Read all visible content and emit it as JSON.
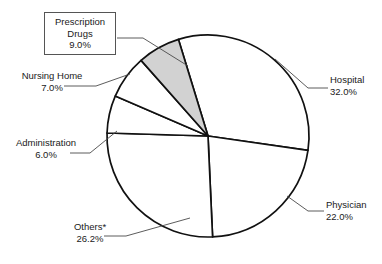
{
  "chart_data": {
    "type": "pie",
    "title": "",
    "subtitle": "",
    "xlabel": "",
    "ylabel": "",
    "legend_position": "callout-labels",
    "grid": false,
    "center": {
      "x": 208,
      "y": 136
    },
    "radius": 101,
    "start_angle_deg": -17,
    "direction": "clockwise",
    "categories": [
      "Hospital",
      "Physician",
      "Others*",
      "Administration",
      "Nursing Home",
      "Prescription Drugs"
    ],
    "values": [
      32.0,
      22.0,
      26.2,
      6.0,
      7.0,
      9.0
    ],
    "value_labels": [
      "32.0%",
      "22.0%",
      "26.2%",
      "6.0%",
      "7.0%",
      "9.0%"
    ],
    "slices": [
      {
        "name": "Hospital",
        "value": 32.0,
        "value_label": "32.0%",
        "fill": "#ffffff",
        "stroke": "#111111",
        "boxed_label": false,
        "start_deg": -17.0,
        "end_deg": 98.2
      },
      {
        "name": "Physician",
        "value": 22.0,
        "value_label": "22.0%",
        "fill": "#ffffff",
        "stroke": "#111111",
        "boxed_label": false,
        "start_deg": 98.2,
        "end_deg": 177.4
      },
      {
        "name": "Others*",
        "value": 26.2,
        "value_label": "26.2%",
        "fill": "#ffffff",
        "stroke": "#111111",
        "boxed_label": false,
        "start_deg": 177.4,
        "end_deg": 271.7
      },
      {
        "name": "Administration",
        "value": 6.0,
        "value_label": "6.0%",
        "fill": "#ffffff",
        "stroke": "#111111",
        "boxed_label": false,
        "start_deg": 271.7,
        "end_deg": 293.3
      },
      {
        "name": "Nursing Home",
        "value": 7.0,
        "value_label": "7.0%",
        "fill": "#ffffff",
        "stroke": "#111111",
        "boxed_label": false,
        "start_deg": 293.3,
        "end_deg": 318.5
      },
      {
        "name": "Prescription Drugs",
        "value": 9.0,
        "value_label": "9.0%",
        "fill": "#d2d2d2",
        "stroke": "#111111",
        "boxed_label": true,
        "start_deg": 318.5,
        "end_deg": 343.0
      }
    ],
    "colors": {
      "slice_default_fill": "#ffffff",
      "slice_highlight_fill": "#d2d2d2",
      "slice_stroke": "#111111",
      "leader_line": "#4a4a4a",
      "callout_box_border": "#555555",
      "text": "#1a1a1a",
      "background": "#ffffff"
    }
  },
  "labels": {
    "prescription_drugs": {
      "name_line1": "Prescription",
      "name_line2": "Drugs",
      "value": "9.0%"
    },
    "nursing_home": {
      "name": "Nursing Home",
      "value": "7.0%"
    },
    "administration": {
      "name": "Administration",
      "value": "6.0%"
    },
    "others": {
      "name": "Others*",
      "value": "26.2%"
    },
    "hospital": {
      "name": "Hospital",
      "value": "32.0%"
    },
    "physician": {
      "name": "Physician",
      "value": "22.0%"
    }
  }
}
